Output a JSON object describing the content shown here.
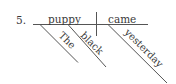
{
  "problem": {
    "number": "5."
  },
  "diagram": {
    "type": "sentence-diagram",
    "subject": "puppy",
    "verb": "came",
    "modifiers": [
      {
        "word": "The",
        "modifies": "puppy"
      },
      {
        "word": "black",
        "modifies": "puppy"
      },
      {
        "word": "yesterday",
        "modifies": "came"
      }
    ],
    "colors": {
      "line": "#555555",
      "text": "#3a3a3a",
      "background": "#ffffff"
    }
  }
}
